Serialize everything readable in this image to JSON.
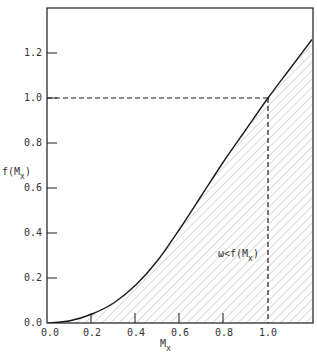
{
  "chart_data": {
    "type": "area",
    "title": "",
    "xlabel": "M_x",
    "ylabel": "f(M_x)",
    "xlim": [
      0.0,
      1.2
    ],
    "ylim": [
      0.0,
      1.4
    ],
    "x_ticks": [
      "0.0",
      "0.2",
      "0.4",
      "0.6",
      "0.8",
      "1.0"
    ],
    "y_ticks": [
      "0.0",
      "0.2",
      "0.4",
      "0.6",
      "0.8",
      "1.0",
      "1.2"
    ],
    "grid": false,
    "series": [
      {
        "name": "f(M_x)",
        "x": [
          0.0,
          0.1,
          0.2,
          0.3,
          0.4,
          0.5,
          0.6,
          0.7,
          0.8,
          0.9,
          1.0,
          1.1,
          1.2
        ],
        "values": [
          0.0,
          0.01,
          0.04,
          0.09,
          0.17,
          0.28,
          0.42,
          0.57,
          0.72,
          0.86,
          1.0,
          1.13,
          1.26
        ]
      }
    ],
    "shaded_region": "area under f(M_x) curve (hatched)",
    "reference_lines": [
      {
        "type": "horizontal-dashed",
        "y": 1.0,
        "from_x": 0.0,
        "to_x": 1.0
      },
      {
        "type": "vertical-dashed",
        "x": 1.0,
        "from_y": 0.0,
        "to_y": 1.0
      }
    ],
    "annotations": [
      {
        "text": "ω<f(M_x)",
        "x": 0.98,
        "y": 0.3
      }
    ]
  },
  "labels": {
    "ylabel_main": "f(M",
    "ylabel_sub": "x",
    "ylabel_close": ")",
    "xlabel_main": "M",
    "xlabel_sub": "x",
    "annotation_main": "ω<f(M",
    "annotation_sub": "x",
    "annotation_close": ")",
    "tick_x0": "0.0",
    "tick_x1": "0.2",
    "tick_x2": "0.4",
    "tick_x3": "0.6",
    "tick_x4": "0.8",
    "tick_x5": "1.0",
    "tick_y0": "0.0",
    "tick_y1": "0.2",
    "tick_y2": "0.4",
    "tick_y3": "0.6",
    "tick_y4": "0.8",
    "tick_y5": "1.0",
    "tick_y6": "1.2"
  },
  "colors": {
    "line": "#1a1a1a",
    "hatch": "#9a9a9a",
    "background": "#ffffff"
  }
}
